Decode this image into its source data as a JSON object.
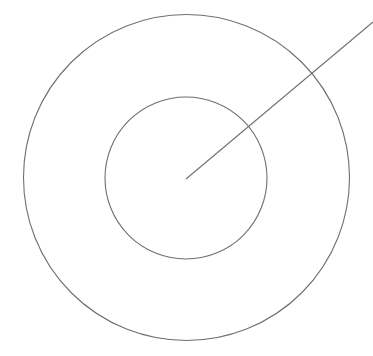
{
  "diagram": {
    "width": 373,
    "height": 356,
    "background": "#ffffff",
    "stroke_color": "#6f6f6f",
    "stroke_width": 1.1,
    "center": {
      "x": 186.5,
      "y": 178
    },
    "outer_circle": {
      "cx": 186.5,
      "cy": 177.5,
      "r": 163
    },
    "inner_circle": {
      "cx": 186,
      "cy": 178,
      "r": 81
    },
    "radius_line": {
      "x1": 186,
      "y1": 179,
      "x2": 373,
      "y2": 22
    }
  }
}
